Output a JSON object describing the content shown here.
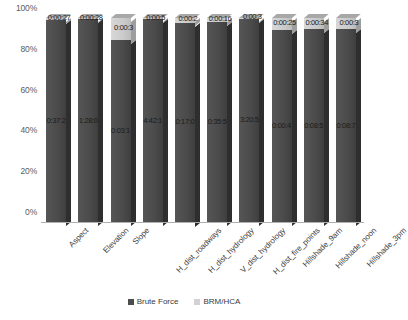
{
  "chart_data": {
    "type": "bar",
    "subtype": "100% stacked bar",
    "title": "",
    "xlabel": "",
    "ylabel": "",
    "ylim": [
      0,
      100
    ],
    "yticks": [
      "0%",
      "20%",
      "40%",
      "60%",
      "80%",
      "100%"
    ],
    "ytick_values": [
      0,
      20,
      40,
      60,
      80,
      100
    ],
    "grid": false,
    "legend_position": "bottom",
    "categories": [
      "Aspect",
      "Elevation",
      "Slope",
      "H_dist_roadways",
      "H_dist_hydrology",
      "V_dist_hydrology",
      "H_dist_fire_points",
      "Hillshade_9am",
      "Hillshade_noon",
      "Hillshade_3pm"
    ],
    "series": [
      {
        "name": "Brute Force",
        "color": "#4d4d4d",
        "percent": [
          99.0,
          99.3,
          89.0,
          99.5,
          97.8,
          98.0,
          99.6,
          94.0,
          94.5,
          94.5
        ],
        "labels": [
          "0:37:2",
          "1:28:0",
          "0:03:1",
          "4:42:1",
          "0:17:0",
          "0:35:5",
          "3:20:5",
          "0:00:4",
          "0:08:5",
          "0:08:7"
        ]
      },
      {
        "name": "BRM/HCA",
        "color": "#d2d2d2",
        "percent": [
          1.0,
          0.7,
          11.0,
          0.5,
          2.2,
          2.0,
          0.4,
          6.0,
          5.5,
          5.5
        ],
        "labels": [
          "0:00:27",
          "0:00:28",
          "0:00:3",
          "0:00:5",
          "0:00:2",
          "0:00:16",
          "0:00:3",
          "0:00:25",
          "0:00:34",
          "0:00:3"
        ]
      }
    ]
  },
  "legend": {
    "items": [
      {
        "label": "Brute Force"
      },
      {
        "label": "BRM/HCA"
      }
    ]
  }
}
